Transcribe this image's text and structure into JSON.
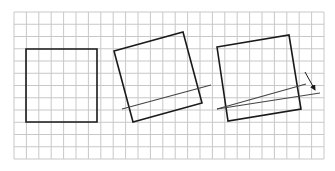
{
  "diagram": {
    "grid": {
      "x0": 14,
      "y0": 12,
      "x1": 324,
      "y1": 159,
      "cols": 25,
      "rows": 12,
      "color": "#c8c8c8"
    },
    "stroke_color": "#1a1a1a",
    "line_color": "#444444",
    "figures": [
      {
        "name": "square-original",
        "points": "26,49 97,49 97,122 26,122"
      },
      {
        "name": "square-rotated",
        "points": "114,51 183,32 202,103 133,122",
        "line": {
          "x1": 122,
          "y1": 109,
          "x2": 211,
          "y2": 85
        }
      },
      {
        "name": "square-rotated-with-angle",
        "points": "217,47 289,35 301,109 228,121",
        "lines": [
          {
            "x1": 217,
            "y1": 109,
            "x2": 306,
            "y2": 84
          },
          {
            "x1": 217,
            "y1": 109,
            "x2": 320,
            "y2": 93
          }
        ],
        "arrow": {
          "x1": 305,
          "y1": 72,
          "x2": 315,
          "y2": 90
        }
      }
    ]
  }
}
